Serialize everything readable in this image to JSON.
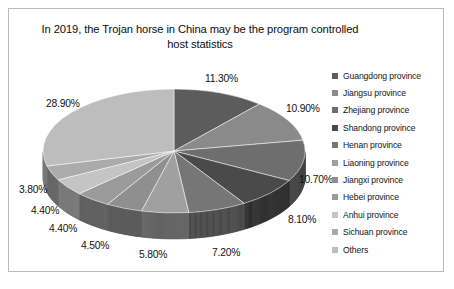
{
  "chart": {
    "title": "In 2019, the Trojan horse in China may be the program controlled host statistics"
  },
  "chart_data": {
    "type": "pie",
    "title": "In 2019, the Trojan horse in China may be the program controlled host statistics",
    "xlabel": "",
    "ylabel": "",
    "legend_position": "right",
    "grid": false,
    "three_d": true,
    "start_angle_deg": 0,
    "direction": "clockwise",
    "categories": [
      "Guangdong province",
      "Jiangsu province",
      "Zhejiang province",
      "Shandong province",
      "Henan province",
      "Liaoning province",
      "Jiangxi province",
      "Hebei province",
      "Anhui province",
      "Sichuan province",
      "Others"
    ],
    "values": [
      11.3,
      10.9,
      10.7,
      8.1,
      7.2,
      5.8,
      4.5,
      4.4,
      4.4,
      3.8,
      28.9
    ],
    "value_labels": [
      "11.30%",
      "10.90%",
      "10.70%",
      "8.10%",
      "7.20%",
      "5.80%",
      "4.50%",
      "4.40%",
      "4.40%",
      "3.80%",
      "28.90%"
    ],
    "colors": [
      "#5c5c5c",
      "#8a8a8a",
      "#6e6e6e",
      "#4a4a4a",
      "#767676",
      "#a0a0a0",
      "#8f8f8f",
      "#9b9b9b",
      "#c4c4c4",
      "#ababab",
      "#bdbdbd"
    ],
    "total": 100.0
  },
  "legend": {
    "items": [
      {
        "label": "Guangdong province",
        "color": "#5c5c5c"
      },
      {
        "label": "Jiangsu province",
        "color": "#8a8a8a"
      },
      {
        "label": "Zhejiang province",
        "color": "#6e6e6e"
      },
      {
        "label": "Shandong province",
        "color": "#4a4a4a"
      },
      {
        "label": "Henan province",
        "color": "#767676"
      },
      {
        "label": "Liaoning province",
        "color": "#a0a0a0"
      },
      {
        "label": "Jiangxi province",
        "color": "#8f8f8f"
      },
      {
        "label": "Hebei province",
        "color": "#9b9b9b"
      },
      {
        "label": "Anhui province",
        "color": "#c4c4c4"
      },
      {
        "label": "Sichuan province",
        "color": "#ababab"
      },
      {
        "label": "Others",
        "color": "#bdbdbd"
      }
    ]
  },
  "label_positions": [
    {
      "idx": 0,
      "left": 196,
      "top": 64
    },
    {
      "idx": 1,
      "left": 277,
      "top": 94
    },
    {
      "idx": 2,
      "left": 290,
      "top": 165
    },
    {
      "idx": 3,
      "left": 279,
      "top": 205
    },
    {
      "idx": 4,
      "left": 203,
      "top": 238
    },
    {
      "idx": 5,
      "left": 130,
      "top": 240
    },
    {
      "idx": 6,
      "left": 72,
      "top": 231
    },
    {
      "idx": 7,
      "left": 40,
      "top": 214
    },
    {
      "idx": 8,
      "left": 22,
      "top": 196
    },
    {
      "idx": 9,
      "left": 10,
      "top": 175
    },
    {
      "idx": 10,
      "left": 37,
      "top": 89
    }
  ]
}
